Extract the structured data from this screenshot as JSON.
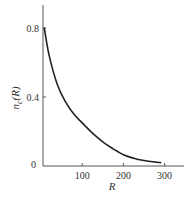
{
  "chart_data": {
    "type": "line",
    "title": "",
    "xlabel": "R",
    "ylabel": "n_c(R)",
    "xlim": [
      0,
      340
    ],
    "ylim": [
      0,
      0.95
    ],
    "grid": false,
    "legend": null,
    "x_ticks": [
      {
        "value": 100,
        "label": "100"
      },
      {
        "value": 200,
        "label": "200"
      },
      {
        "value": 300,
        "label": "300"
      }
    ],
    "y_ticks": [
      {
        "value": 0,
        "label": "0"
      },
      {
        "value": 0.4,
        "label": "0.4"
      },
      {
        "value": 0.8,
        "label": "0.8"
      }
    ],
    "series": [
      {
        "name": "n_c(R)",
        "color": "#222222",
        "x": [
          8,
          20,
          40,
          60,
          80,
          100,
          125,
          150,
          175,
          200,
          225,
          250,
          275,
          290
        ],
        "y": [
          0.8,
          0.64,
          0.47,
          0.37,
          0.3,
          0.25,
          0.19,
          0.14,
          0.1,
          0.065,
          0.045,
          0.032,
          0.024,
          0.02
        ]
      }
    ]
  },
  "labels": {
    "xlabel": "R",
    "ylabel_main": "n",
    "ylabel_sub": "c",
    "ylabel_tail": "(R)"
  }
}
